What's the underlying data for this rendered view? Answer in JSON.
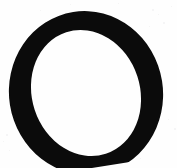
{
  "image": {
    "kind": "scanned-glyph",
    "character": "O",
    "description": "Uppercase letter O, high-contrast Didone serif, slightly tilted, cropped at bottom edge",
    "width_px": 177,
    "height_px": 168,
    "background_color": "#fefefe",
    "ink_color": "#0b0b0b",
    "speckle_color": "#e9e9ea",
    "is_cropped_bottom": true
  },
  "glyph": {
    "letter": "O",
    "case": "uppercase",
    "style": "didone-serif-italic",
    "ink_color": "#0b0b0b",
    "outer": {
      "center_x": 86,
      "center_y": 93,
      "radius_x": 77,
      "radius_y": 82,
      "rotation_deg": -9
    },
    "counter": {
      "center_x": 86,
      "center_y": 93,
      "radius_x": 54,
      "radius_y": 64,
      "rotation_deg": -9
    },
    "stroke_thickness": {
      "left_px": 22,
      "right_px": 20,
      "top_px": 9,
      "bottom_px": 11
    },
    "bounds": {
      "left_px": 8,
      "right_px": 163,
      "top_px": 14,
      "bottom_px": 168
    }
  },
  "speckles": [
    {
      "x": 152,
      "y": 9,
      "size": 2
    },
    {
      "x": 158,
      "y": 14,
      "size": 1
    },
    {
      "x": 163,
      "y": 22,
      "size": 2
    },
    {
      "x": 149,
      "y": 26,
      "size": 1
    },
    {
      "x": 171,
      "y": 6,
      "size": 1
    },
    {
      "x": 6,
      "y": 134,
      "size": 2
    },
    {
      "x": 3,
      "y": 141,
      "size": 1
    },
    {
      "x": 9,
      "y": 150,
      "size": 1
    },
    {
      "x": 168,
      "y": 119,
      "size": 1
    },
    {
      "x": 174,
      "y": 128,
      "size": 2
    },
    {
      "x": 140,
      "y": 158,
      "size": 1
    },
    {
      "x": 70,
      "y": 4,
      "size": 1
    },
    {
      "x": 40,
      "y": 10,
      "size": 1
    },
    {
      "x": 118,
      "y": 3,
      "size": 1
    }
  ]
}
